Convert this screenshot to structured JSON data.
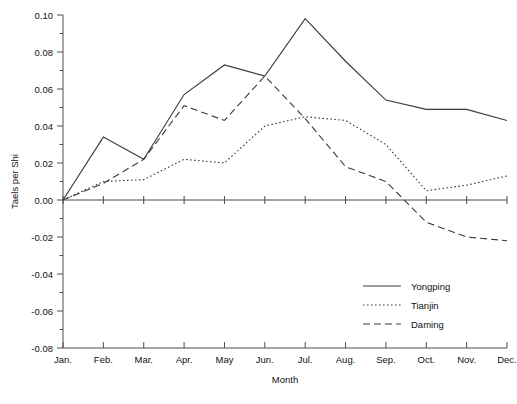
{
  "chart_data": {
    "type": "line",
    "title": "",
    "xlabel": "Month",
    "ylabel": "Taels per Shi",
    "categories": [
      "Jan.",
      "Feb.",
      "Mar.",
      "Apr.",
      "May",
      "Jun.",
      "Jul.",
      "Aug.",
      "Sep.",
      "Oct.",
      "Nov.",
      "Dec."
    ],
    "ylim": [
      -0.08,
      0.1
    ],
    "yticks": [
      0.1,
      0.08,
      0.06,
      0.04,
      0.02,
      0.0,
      -0.02,
      -0.04,
      -0.06,
      -0.08
    ],
    "ytick_labels": [
      "0.10",
      "0.08",
      "0.06",
      "0.04",
      "0.02",
      "0.00",
      "-0.02",
      "-0.04",
      "-0.06",
      "-0.08"
    ],
    "minor_ticks": true,
    "grid": false,
    "legend_position": "bottom-right",
    "series": [
      {
        "name": "Yongping",
        "style": "solid",
        "color": "#3a3a3a",
        "values": [
          0.0,
          0.034,
          0.022,
          0.057,
          0.073,
          0.067,
          0.098,
          0.075,
          0.054,
          0.049,
          0.049,
          0.043
        ]
      },
      {
        "name": "Tianjin",
        "style": "dotted",
        "color": "#3a3a3a",
        "values": [
          0.0,
          0.01,
          0.011,
          0.022,
          0.02,
          0.04,
          0.045,
          0.043,
          0.03,
          0.005,
          0.008,
          0.013
        ]
      },
      {
        "name": "Daming",
        "style": "dashed",
        "color": "#3a3a3a",
        "values": [
          0.0,
          0.009,
          0.022,
          0.051,
          0.043,
          0.067,
          0.044,
          0.018,
          0.01,
          -0.012,
          -0.02,
          -0.022
        ]
      }
    ]
  },
  "axes": {
    "y_title": "Taels per Shi",
    "x_title": "Month"
  },
  "legend": {
    "items": [
      {
        "label": "Yongping"
      },
      {
        "label": "Tianjin"
      },
      {
        "label": "Daming"
      }
    ]
  }
}
